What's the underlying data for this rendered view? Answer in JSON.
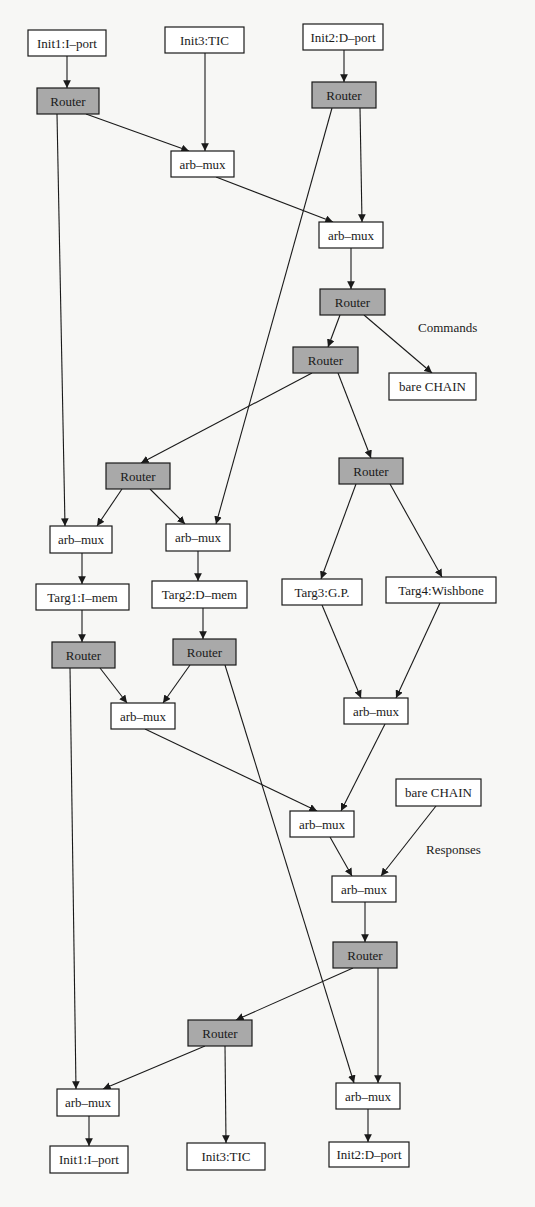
{
  "diagram": {
    "type": "directed-graph",
    "colors": {
      "background": "#f7f7f5",
      "router_fill": "#a9a9a9",
      "plain_fill": "#ffffff",
      "stroke": "#1a1a1a"
    },
    "labels": [
      {
        "id": "commands",
        "text": "Commands",
        "x": 418,
        "y": 332
      },
      {
        "id": "responses",
        "text": "Responses",
        "x": 426,
        "y": 854
      }
    ],
    "nodes": [
      {
        "id": "n1",
        "label": "Init1:I–port",
        "kind": "plain",
        "x": 28,
        "y": 30,
        "w": 78,
        "h": 26
      },
      {
        "id": "n2",
        "label": "Init3:TIC",
        "kind": "plain",
        "x": 165,
        "y": 27,
        "w": 79,
        "h": 26
      },
      {
        "id": "n3",
        "label": "Init2:D–port",
        "kind": "plain",
        "x": 303,
        "y": 24,
        "w": 80,
        "h": 26
      },
      {
        "id": "n4",
        "label": "Router",
        "kind": "router",
        "x": 37,
        "y": 88,
        "w": 62,
        "h": 26
      },
      {
        "id": "n5",
        "label": "Router",
        "kind": "router",
        "x": 312,
        "y": 82,
        "w": 64,
        "h": 26
      },
      {
        "id": "n6",
        "label": "arb–mux",
        "kind": "plain",
        "x": 171,
        "y": 151,
        "w": 63,
        "h": 26
      },
      {
        "id": "n7",
        "label": "arb–mux",
        "kind": "plain",
        "x": 319,
        "y": 222,
        "w": 64,
        "h": 26
      },
      {
        "id": "n8",
        "label": "Router",
        "kind": "router",
        "x": 320,
        "y": 289,
        "w": 65,
        "h": 26
      },
      {
        "id": "n9",
        "label": "Router",
        "kind": "router",
        "x": 293,
        "y": 347,
        "w": 65,
        "h": 26
      },
      {
        "id": "n10",
        "label": "bare CHAIN",
        "kind": "plain",
        "x": 389,
        "y": 373,
        "w": 87,
        "h": 27
      },
      {
        "id": "n11",
        "label": "Router",
        "kind": "router",
        "x": 106,
        "y": 463,
        "w": 64,
        "h": 26
      },
      {
        "id": "n12",
        "label": "Router",
        "kind": "router",
        "x": 339,
        "y": 458,
        "w": 64,
        "h": 26
      },
      {
        "id": "n13",
        "label": "arb–mux",
        "kind": "plain",
        "x": 50,
        "y": 526,
        "w": 62,
        "h": 27
      },
      {
        "id": "n14",
        "label": "arb–mux",
        "kind": "plain",
        "x": 166,
        "y": 524,
        "w": 64,
        "h": 27
      },
      {
        "id": "n15",
        "label": "Targ1:I–mem",
        "kind": "plain",
        "x": 36,
        "y": 584,
        "w": 93,
        "h": 26
      },
      {
        "id": "n16",
        "label": "Targ2:D–mem",
        "kind": "plain",
        "x": 152,
        "y": 581,
        "w": 95,
        "h": 27
      },
      {
        "id": "n17",
        "label": "Targ3:G.P.",
        "kind": "plain",
        "x": 282,
        "y": 579,
        "w": 80,
        "h": 26
      },
      {
        "id": "n18",
        "label": "Targ4:Wishbone",
        "kind": "plain",
        "x": 386,
        "y": 577,
        "w": 110,
        "h": 26
      },
      {
        "id": "n19",
        "label": "Router",
        "kind": "router",
        "x": 52,
        "y": 642,
        "w": 63,
        "h": 26
      },
      {
        "id": "n20",
        "label": "Router",
        "kind": "router",
        "x": 173,
        "y": 639,
        "w": 63,
        "h": 26
      },
      {
        "id": "n21",
        "label": "arb–mux",
        "kind": "plain",
        "x": 111,
        "y": 703,
        "w": 64,
        "h": 26
      },
      {
        "id": "n22",
        "label": "arb–mux",
        "kind": "plain",
        "x": 344,
        "y": 698,
        "w": 64,
        "h": 26
      },
      {
        "id": "n23",
        "label": "bare CHAIN",
        "kind": "plain",
        "x": 396,
        "y": 779,
        "w": 85,
        "h": 27
      },
      {
        "id": "n24",
        "label": "arb–mux",
        "kind": "plain",
        "x": 290,
        "y": 811,
        "w": 64,
        "h": 26
      },
      {
        "id": "n25",
        "label": "arb–mux",
        "kind": "plain",
        "x": 332,
        "y": 876,
        "w": 64,
        "h": 26
      },
      {
        "id": "n26",
        "label": "Router",
        "kind": "router",
        "x": 333,
        "y": 942,
        "w": 64,
        "h": 26
      },
      {
        "id": "n27",
        "label": "Router",
        "kind": "router",
        "x": 188,
        "y": 1020,
        "w": 64,
        "h": 26
      },
      {
        "id": "n28",
        "label": "arb–mux",
        "kind": "plain",
        "x": 57,
        "y": 1089,
        "w": 62,
        "h": 27
      },
      {
        "id": "n29",
        "label": "arb–mux",
        "kind": "plain",
        "x": 336,
        "y": 1083,
        "w": 64,
        "h": 26
      },
      {
        "id": "n30",
        "label": "Init1:I–port",
        "kind": "plain",
        "x": 50,
        "y": 1146,
        "w": 78,
        "h": 27
      },
      {
        "id": "n31",
        "label": "Init3:TIC",
        "kind": "plain",
        "x": 187,
        "y": 1143,
        "w": 78,
        "h": 27
      },
      {
        "id": "n32",
        "label": "Init2:D–port",
        "kind": "plain",
        "x": 329,
        "y": 1142,
        "w": 80,
        "h": 25
      }
    ],
    "edges": [
      {
        "from": "n1",
        "to": "n4",
        "x1": 67,
        "y1": 56,
        "x2": 67,
        "y2": 88
      },
      {
        "from": "n4",
        "to": "n6",
        "x1": 86,
        "y1": 114,
        "x2": 189,
        "y2": 151
      },
      {
        "from": "n2",
        "to": "n6",
        "x1": 205,
        "y1": 53,
        "x2": 205,
        "y2": 151
      },
      {
        "from": "n3",
        "to": "n5",
        "x1": 344,
        "y1": 50,
        "x2": 344,
        "y2": 82
      },
      {
        "from": "n5",
        "to": "n7",
        "x1": 360,
        "y1": 108,
        "x2": 362,
        "y2": 222
      },
      {
        "from": "n6",
        "to": "n7",
        "x1": 216,
        "y1": 177,
        "x2": 333,
        "y2": 222
      },
      {
        "from": "n4",
        "to": "n13",
        "x1": 57,
        "y1": 114,
        "x2": 65,
        "y2": 526
      },
      {
        "from": "n5",
        "to": "n14",
        "x1": 332,
        "y1": 108,
        "x2": 216,
        "y2": 524
      },
      {
        "from": "n7",
        "to": "n8",
        "x1": 351,
        "y1": 248,
        "x2": 351,
        "y2": 289
      },
      {
        "from": "n8",
        "to": "n9",
        "x1": 340,
        "y1": 315,
        "x2": 328,
        "y2": 347
      },
      {
        "from": "n8",
        "to": "n10",
        "x1": 364,
        "y1": 315,
        "x2": 432,
        "y2": 373
      },
      {
        "from": "n9",
        "to": "n11",
        "x1": 312,
        "y1": 373,
        "x2": 141,
        "y2": 463
      },
      {
        "from": "n9",
        "to": "n12",
        "x1": 338,
        "y1": 373,
        "x2": 371,
        "y2": 458
      },
      {
        "from": "n11",
        "to": "n13",
        "x1": 122,
        "y1": 489,
        "x2": 97,
        "y2": 526
      },
      {
        "from": "n11",
        "to": "n14",
        "x1": 150,
        "y1": 489,
        "x2": 185,
        "y2": 524
      },
      {
        "from": "n12",
        "to": "n17",
        "x1": 356,
        "y1": 484,
        "x2": 321,
        "y2": 579
      },
      {
        "from": "n12",
        "to": "n18",
        "x1": 390,
        "y1": 484,
        "x2": 442,
        "y2": 577
      },
      {
        "from": "n13",
        "to": "n15",
        "x1": 82,
        "y1": 553,
        "x2": 82,
        "y2": 584
      },
      {
        "from": "n14",
        "to": "n16",
        "x1": 198,
        "y1": 551,
        "x2": 198,
        "y2": 581
      },
      {
        "from": "n15",
        "to": "n19",
        "x1": 82,
        "y1": 610,
        "x2": 82,
        "y2": 642
      },
      {
        "from": "n16",
        "to": "n20",
        "x1": 203,
        "y1": 608,
        "x2": 203,
        "y2": 639
      },
      {
        "from": "n19",
        "to": "n21",
        "x1": 100,
        "y1": 668,
        "x2": 127,
        "y2": 703
      },
      {
        "from": "n20",
        "to": "n21",
        "x1": 190,
        "y1": 665,
        "x2": 163,
        "y2": 703
      },
      {
        "from": "n17",
        "to": "n22",
        "x1": 322,
        "y1": 605,
        "x2": 361,
        "y2": 698
      },
      {
        "from": "n18",
        "to": "n22",
        "x1": 440,
        "y1": 603,
        "x2": 396,
        "y2": 698
      },
      {
        "from": "n21",
        "to": "n24",
        "x1": 145,
        "y1": 729,
        "x2": 317,
        "y2": 811
      },
      {
        "from": "n22",
        "to": "n24",
        "x1": 385,
        "y1": 724,
        "x2": 341,
        "y2": 811
      },
      {
        "from": "n24",
        "to": "n25",
        "x1": 330,
        "y1": 837,
        "x2": 352,
        "y2": 876
      },
      {
        "from": "n23",
        "to": "n25",
        "x1": 436,
        "y1": 806,
        "x2": 381,
        "y2": 876
      },
      {
        "from": "n25",
        "to": "n26",
        "x1": 365,
        "y1": 902,
        "x2": 365,
        "y2": 942
      },
      {
        "from": "n26",
        "to": "n27",
        "x1": 353,
        "y1": 968,
        "x2": 236,
        "y2": 1020
      },
      {
        "from": "n26",
        "to": "n29",
        "x1": 378,
        "y1": 968,
        "x2": 378,
        "y2": 1083
      },
      {
        "from": "n20",
        "to": "n29",
        "x1": 225,
        "y1": 665,
        "x2": 354,
        "y2": 1083
      },
      {
        "from": "n19",
        "to": "n28",
        "x1": 70,
        "y1": 668,
        "x2": 76,
        "y2": 1089
      },
      {
        "from": "n27",
        "to": "n28",
        "x1": 205,
        "y1": 1046,
        "x2": 103,
        "y2": 1089
      },
      {
        "from": "n27",
        "to": "n31",
        "x1": 225,
        "y1": 1046,
        "x2": 226,
        "y2": 1143
      },
      {
        "from": "n28",
        "to": "n30",
        "x1": 89,
        "y1": 1116,
        "x2": 89,
        "y2": 1146
      },
      {
        "from": "n29",
        "to": "n32",
        "x1": 368,
        "y1": 1109,
        "x2": 368,
        "y2": 1142
      }
    ]
  }
}
